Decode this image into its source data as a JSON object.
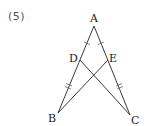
{
  "problem": {
    "number": "(5)"
  },
  "figure": {
    "type": "geometry",
    "vertices": {
      "A": {
        "label": "A",
        "x": 94,
        "y": 26
      },
      "B": {
        "label": "B",
        "x": 58,
        "y": 113
      },
      "C": {
        "label": "C",
        "x": 130,
        "y": 115
      },
      "D": {
        "label": "D",
        "x": 80,
        "y": 60
      },
      "E": {
        "label": "E",
        "x": 108,
        "y": 60
      }
    },
    "segments": [
      {
        "from": "A",
        "to": "B"
      },
      {
        "from": "A",
        "to": "C"
      },
      {
        "from": "B",
        "to": "E"
      },
      {
        "from": "D",
        "to": "C"
      }
    ],
    "equal_marks": [
      {
        "segment": "AD",
        "ticks": 1
      },
      {
        "segment": "AE",
        "ticks": 1
      },
      {
        "segment": "DB",
        "ticks": 2
      },
      {
        "segment": "EC",
        "ticks": 2
      }
    ],
    "colors": {
      "line": "#3a3a3a",
      "label": "#222222",
      "number": "#555555"
    }
  }
}
